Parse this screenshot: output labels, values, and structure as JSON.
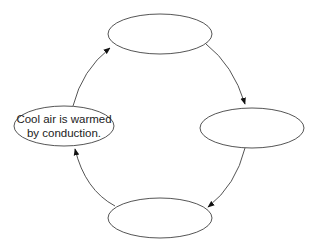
{
  "diagram": {
    "type": "cycle",
    "nodes": [
      {
        "id": "top",
        "label": ""
      },
      {
        "id": "right",
        "label": ""
      },
      {
        "id": "bottom",
        "label": ""
      },
      {
        "id": "left",
        "label_line1": "Cool air is warmed",
        "label_line2": "by conduction."
      }
    ],
    "edges": [
      {
        "from": "left",
        "to": "top"
      },
      {
        "from": "top",
        "to": "right"
      },
      {
        "from": "right",
        "to": "bottom"
      },
      {
        "from": "bottom",
        "to": "left"
      }
    ],
    "colors": {
      "stroke": "#444444",
      "background": "#ffffff",
      "text": "#222222"
    }
  }
}
